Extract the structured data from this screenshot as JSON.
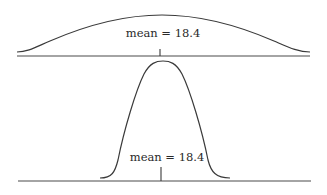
{
  "diagram": {
    "panels": [
      {
        "id": "wide",
        "label": "mean = 18.4",
        "spread": "wide",
        "mean": 18.4
      },
      {
        "id": "narrow",
        "label": "mean = 18.4",
        "spread": "narrow",
        "mean": 18.4
      }
    ]
  },
  "colors": {
    "line": "#3a3a3a",
    "axis": "#4a4a4a",
    "text": "#2a2a2a",
    "background": "#ffffff"
  }
}
